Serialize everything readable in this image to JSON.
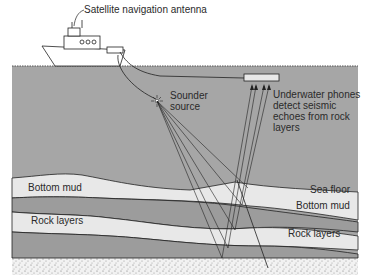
{
  "diagram": {
    "colors": {
      "sea": "#a6a6a6",
      "mud": "#e8e8e8",
      "rock": "#9c9c9c",
      "line": "#222222",
      "bedrock": "#f2f2f2"
    },
    "labels": {
      "antenna": "Satellite navigation antenna",
      "sounder": "Sounder\nsource",
      "phones": "Underwater phones\ndetect seismic\nechoes from rock\nlayers",
      "sea_floor": "Sea floor",
      "bottom_mud_left": "Bottom mud",
      "bottom_mud_right": "Bottom mud",
      "rock_layers_left": "Rock layers",
      "rock_layers_right": "Rock layers"
    }
  }
}
